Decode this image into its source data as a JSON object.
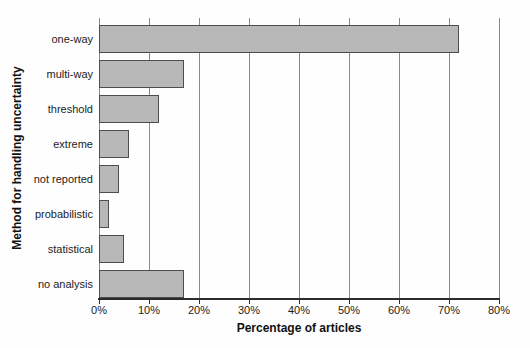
{
  "chart_data": {
    "type": "bar",
    "orientation": "horizontal",
    "title": "",
    "xlabel": "Percentage of articles",
    "ylabel": "Method for handling uncertainty",
    "categories": [
      "one-way",
      "multi-way",
      "threshold",
      "extreme",
      "not reported",
      "probabilistic",
      "statistical",
      "no analysis"
    ],
    "values": [
      72,
      17,
      12,
      6,
      4,
      2,
      5,
      17
    ],
    "unit": "%",
    "xlim": [
      0,
      80
    ],
    "xtick_values": [
      0,
      10,
      20,
      30,
      40,
      50,
      60,
      70,
      80
    ],
    "xtick_labels": [
      "0%",
      "10%",
      "20%",
      "30%",
      "40%",
      "50%",
      "60%",
      "70%",
      "80%"
    ],
    "grid": "vertical gridlines at every 10%, drawn behind bars",
    "legend": "none",
    "colors": {
      "bar_fill": "#b8b8b8",
      "bar_border": "#4d4d4d",
      "gridline": "#8a8a8a",
      "axis_line": "#2b2b2b",
      "text": "#1c1c1c",
      "background": "#fefefe"
    }
  }
}
